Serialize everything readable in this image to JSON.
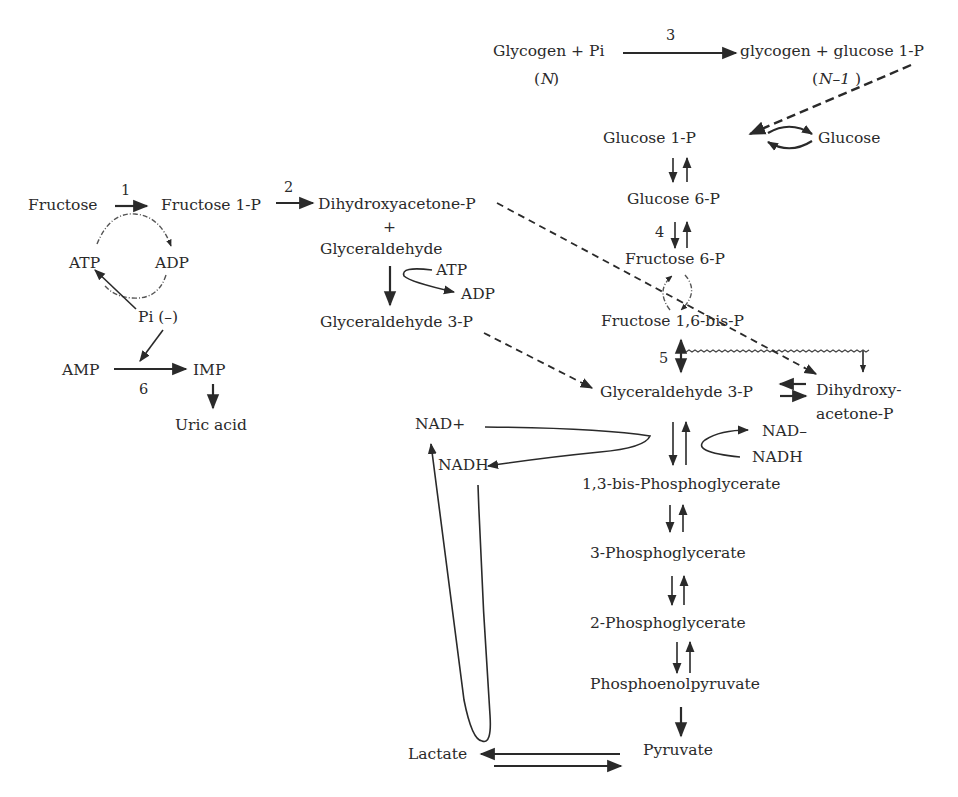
{
  "diagram": {
    "nodes": {
      "glycogen_pi": "Glycogen + Pi",
      "glycogen_n": "N",
      "glycogen_glucose1p": "glycogen + glucose 1-P",
      "glycogen_n_minus_1": "N–1",
      "glucose_1p": "Glucose 1-P",
      "glucose": "Glucose",
      "glucose_6p": "Glucose 6-P",
      "fructose_6p": "Fructose 6-P",
      "fructose_16bisp": "Fructose 1,6-bis-P",
      "fructose": "Fructose",
      "fructose_1p": "Fructose 1-P",
      "dihydroxyacetone_p": "Dihydroxyacetone-P",
      "plus": "+",
      "glyceraldehyde": "Glyceraldehyde",
      "atp_glyc": "ATP",
      "adp_glyc": "ADP",
      "glyceraldehyde_3p_left": "Glyceraldehyde 3-P",
      "atp_left": "ATP",
      "adp_left": "ADP",
      "pi_minus": "Pi (–)",
      "amp": "AMP",
      "imp": "IMP",
      "uric_acid": "Uric acid",
      "glyceraldehyde_3p": "Glyceraldehyde 3-P",
      "dihydroxy_line1": "Dihydroxy-",
      "dihydroxy_line2": "acetone-P",
      "nad_plus": "NAD+",
      "nadh_left": "NADH",
      "nad_right": "NAD–",
      "nadh_right": "NADH",
      "bisphosphoglycerate": "1,3-bis-Phosphoglycerate",
      "phosphoglycerate_3": "3-Phosphoglycerate",
      "phosphoglycerate_2": "2-Phosphoglycerate",
      "phosphoenolpyruvate": "Phosphoenolpyruvate",
      "pyruvate": "Pyruvate",
      "lactate": "Lactate"
    },
    "enzyme_labels": {
      "step1": "1",
      "step2": "2",
      "step3": "3",
      "step4": "4",
      "step5": "5",
      "step6": "6"
    },
    "colors": {
      "ink": "#2a2a2a",
      "background": "#ffffff"
    }
  }
}
